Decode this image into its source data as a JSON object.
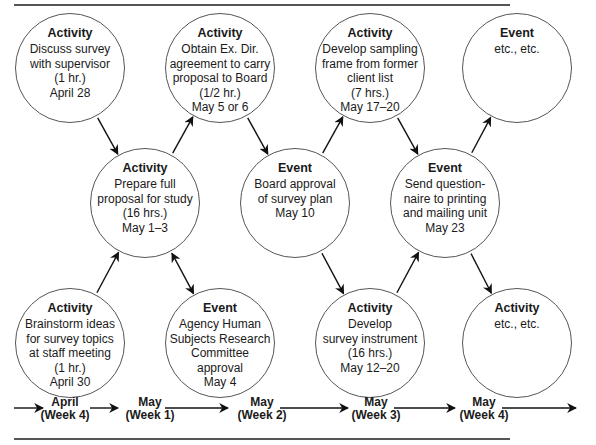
{
  "diagram": {
    "type": "PERT-style activity/event network",
    "nodes": [
      {
        "id": "n1",
        "kind": "Activity",
        "lines": [
          "Discuss survey",
          "with supervisor",
          "(1 hr.)",
          "April 28"
        ],
        "cx": 70,
        "cy": 68
      },
      {
        "id": "n2",
        "kind": "Activity",
        "lines": [
          "Obtain Ex. Dir.",
          "agreement to carry",
          "proposal to Board",
          "(1/2 hr.)",
          "May 5 or 6"
        ],
        "cx": 220,
        "cy": 68
      },
      {
        "id": "n3",
        "kind": "Activity",
        "lines": [
          "Develop sampling",
          "frame from former",
          "client list",
          "(7 hrs.)",
          "May 17–20"
        ],
        "cx": 370,
        "cy": 68
      },
      {
        "id": "n4",
        "kind": "Event",
        "lines": [
          "etc., etc."
        ],
        "cx": 517,
        "cy": 68
      },
      {
        "id": "n5",
        "kind": "Activity",
        "lines": [
          "Prepare full",
          "proposal for study",
          "(16 hrs.)",
          "May 1–3"
        ],
        "cx": 145,
        "cy": 203
      },
      {
        "id": "n6",
        "kind": "Event",
        "lines": [
          "Board approval",
          "of survey plan",
          "May 10"
        ],
        "cx": 295,
        "cy": 203
      },
      {
        "id": "n7",
        "kind": "Event",
        "lines": [
          "Send question-",
          "naire to printing",
          "and mailing unit",
          "May 23"
        ],
        "cx": 445,
        "cy": 203
      },
      {
        "id": "n8",
        "kind": "Activity",
        "lines": [
          "Brainstorm ideas",
          "for survey topics",
          "at staff meeting",
          "(1 hr.)",
          "April 30"
        ],
        "cx": 70,
        "cy": 343
      },
      {
        "id": "n9",
        "kind": "Event",
        "lines": [
          "Agency Human",
          "Subjects Research",
          "Committee",
          "approval",
          "May 4"
        ],
        "cx": 220,
        "cy": 343
      },
      {
        "id": "n10",
        "kind": "Activity",
        "lines": [
          "Develop",
          "survey instrument",
          "(16 hrs.)",
          "May 12–20"
        ],
        "cx": 370,
        "cy": 343
      },
      {
        "id": "n11",
        "kind": "Activity",
        "lines": [
          "etc., etc."
        ],
        "cx": 517,
        "cy": 343
      }
    ],
    "edges": [
      {
        "from": "n1",
        "to": "n5",
        "style": "arrow"
      },
      {
        "from": "n8",
        "to": "n5",
        "style": "arrow"
      },
      {
        "from": "n5",
        "to": "n2",
        "style": "arrow"
      },
      {
        "from": "n5",
        "to": "n9",
        "style": "double-arrow"
      },
      {
        "from": "n2",
        "to": "n6",
        "style": "arrow"
      },
      {
        "from": "n6",
        "to": "n3",
        "style": "arrow"
      },
      {
        "from": "n6",
        "to": "n10",
        "style": "arrow"
      },
      {
        "from": "n3",
        "to": "n7",
        "style": "arrow"
      },
      {
        "from": "n10",
        "to": "n7",
        "style": "arrow"
      },
      {
        "from": "n7",
        "to": "n4",
        "style": "arrow"
      },
      {
        "from": "n7",
        "to": "n11",
        "style": "arrow"
      }
    ]
  },
  "timeline": {
    "labels": [
      {
        "top": "April",
        "bottom": "(Week 4)",
        "x": 65
      },
      {
        "top": "May",
        "bottom": "(Week 1)",
        "x": 150
      },
      {
        "top": "May",
        "bottom": "(Week 2)",
        "x": 262
      },
      {
        "top": "May",
        "bottom": "(Week 3)",
        "x": 376
      },
      {
        "top": "May",
        "bottom": "(Week 4)",
        "x": 484
      }
    ]
  },
  "colors": {
    "stroke": "#555555",
    "arrow": "#111111",
    "text": "#1a1a1a",
    "background": "#ffffff"
  }
}
